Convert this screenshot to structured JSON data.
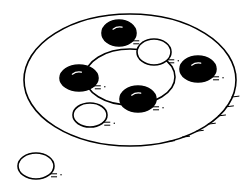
{
  "diagram": {
    "colors": {
      "stroke": "#000000",
      "fill_black": "#000000",
      "fill_white": "#ffffff",
      "highlight": "#ffffff"
    },
    "outer_set": {
      "cx": 130,
      "cy": 80,
      "rx": 106,
      "ry": 66
    },
    "inner_set": {
      "cx": 130,
      "cy": 77,
      "rx": 45,
      "ry": 28
    },
    "elements": [
      {
        "id": "black-top",
        "fill": "black",
        "cx": 119,
        "cy": 33,
        "rx": 17,
        "ry": 13
      },
      {
        "id": "white-top-right",
        "fill": "white",
        "cx": 154,
        "cy": 52,
        "rx": 17,
        "ry": 13
      },
      {
        "id": "black-right",
        "fill": "black",
        "cx": 198,
        "cy": 69,
        "rx": 18,
        "ry": 13
      },
      {
        "id": "black-left",
        "fill": "black",
        "cx": 79,
        "cy": 78,
        "rx": 19,
        "ry": 13
      },
      {
        "id": "black-center",
        "fill": "black",
        "cx": 138,
        "cy": 99,
        "rx": 18,
        "ry": 13
      },
      {
        "id": "white-lower-left",
        "fill": "white",
        "cx": 90,
        "cy": 115,
        "rx": 17,
        "ry": 12
      },
      {
        "id": "white-outside",
        "fill": "white",
        "cx": 36,
        "cy": 166,
        "rx": 18,
        "ry": 13
      }
    ]
  }
}
